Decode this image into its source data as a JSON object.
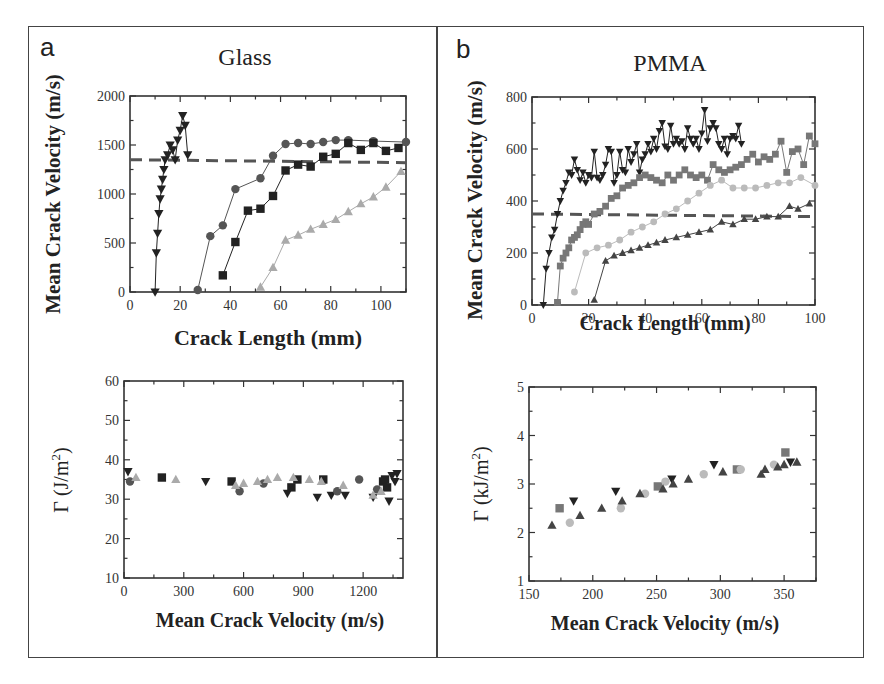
{
  "figure": {
    "panels": [
      {
        "letter": "a",
        "title": "Glass"
      },
      {
        "letter": "b",
        "title": "PMMA"
      }
    ]
  },
  "chart_data": [
    {
      "id": "glass-velocity",
      "panel": "a",
      "type": "line",
      "title": "Glass",
      "xlabel": "Crack Length (mm)",
      "ylabel": "Mean Crack Velocity (m/s)",
      "xlim": [
        0,
        110
      ],
      "ylim": [
        0,
        2000
      ],
      "xticks": [
        0,
        20,
        40,
        60,
        80,
        100
      ],
      "yticks": [
        0,
        500,
        1000,
        1500,
        2000
      ],
      "grid": false,
      "reference_line": {
        "style": "dashed",
        "y_start": 1350,
        "y_end": 1320,
        "color": "#555555"
      },
      "series": [
        {
          "name": "inverted-triangle",
          "marker": "tri-down",
          "color": "#222222",
          "x": [
            10,
            10.5,
            11,
            11.5,
            12,
            12.5,
            13,
            13.5,
            14,
            15,
            16,
            17,
            18,
            19,
            20,
            21,
            22,
            23
          ],
          "y": [
            0,
            400,
            600,
            800,
            950,
            1050,
            1150,
            1250,
            1350,
            1400,
            1500,
            1450,
            1350,
            1550,
            1650,
            1800,
            1700,
            1400
          ]
        },
        {
          "name": "circle",
          "marker": "circle",
          "color": "#555555",
          "x": [
            27,
            32,
            37,
            42,
            52,
            57,
            62,
            67,
            72,
            77,
            82,
            87,
            97,
            110
          ],
          "y": [
            20,
            570,
            680,
            1050,
            1160,
            1390,
            1510,
            1520,
            1510,
            1530,
            1550,
            1550,
            1540,
            1530
          ]
        },
        {
          "name": "square",
          "marker": "square",
          "color": "#222222",
          "x": [
            37,
            42,
            47,
            52,
            57,
            62,
            67,
            72,
            77,
            82,
            87,
            92,
            97,
            102,
            107
          ],
          "y": [
            170,
            510,
            830,
            850,
            980,
            1240,
            1300,
            1280,
            1380,
            1410,
            1520,
            1450,
            1520,
            1440,
            1470
          ]
        },
        {
          "name": "triangle",
          "marker": "tri-up",
          "color": "#aaaaaa",
          "x": [
            52,
            57,
            62,
            67,
            72,
            77,
            82,
            87,
            92,
            97,
            102,
            108
          ],
          "y": [
            50,
            250,
            530,
            580,
            640,
            690,
            740,
            820,
            900,
            970,
            1070,
            1230
          ]
        }
      ]
    },
    {
      "id": "glass-toughness",
      "panel": "a",
      "type": "scatter",
      "xlabel": "Mean Crack Velocity (m/s)",
      "ylabel": "Γ (J/m²)",
      "ylabel_base": "Γ (J/m",
      "ylabel_sup": "2",
      "ylabel_end": ")",
      "xlim": [
        0,
        1400
      ],
      "ylim": [
        10,
        60
      ],
      "xticks": [
        0,
        300,
        600,
        900,
        1200
      ],
      "yticks": [
        10,
        20,
        30,
        40,
        50,
        60
      ],
      "grid": false,
      "series": [
        {
          "name": "inverted-triangle",
          "marker": "tri-down",
          "color": "#222222",
          "x": [
            20,
            410,
            820,
            970,
            1040,
            1110,
            1250,
            1330,
            1345,
            1370,
            1360
          ],
          "y": [
            37,
            34.5,
            31.5,
            30.5,
            31,
            31,
            30.5,
            29.5,
            36,
            36.5,
            34.5
          ]
        },
        {
          "name": "circle",
          "marker": "circle",
          "color": "#555555",
          "x": [
            30,
            580,
            700,
            1070,
            1180,
            1270
          ],
          "y": [
            34.5,
            32,
            34,
            32,
            35,
            32.5
          ]
        },
        {
          "name": "square",
          "marker": "square",
          "color": "#222222",
          "x": [
            190,
            540,
            840,
            870,
            1000,
            1300,
            1320,
            1310
          ],
          "y": [
            35.5,
            34.5,
            33,
            35,
            35,
            34.5,
            33,
            35
          ]
        },
        {
          "name": "triangle",
          "marker": "tri-up",
          "color": "#aaaaaa",
          "x": [
            60,
            260,
            560,
            600,
            670,
            720,
            770,
            850,
            930,
            990,
            1100,
            1250,
            1290
          ],
          "y": [
            35.5,
            35,
            33.5,
            34,
            34.5,
            35,
            35.5,
            35.5,
            35,
            34.5,
            33.5,
            31,
            32
          ]
        }
      ]
    },
    {
      "id": "pmma-velocity",
      "panel": "b",
      "type": "line",
      "title": "PMMA",
      "xlabel": "Crack Length (mm)",
      "ylabel": "Mean Crack Velocity (m/s)",
      "xlim": [
        0,
        100
      ],
      "ylim": [
        0,
        800
      ],
      "xticks": [
        0,
        20,
        40,
        60,
        80,
        100
      ],
      "yticks": [
        0,
        200,
        400,
        600,
        800
      ],
      "grid": false,
      "reference_line": {
        "style": "dashed",
        "y_start": 350,
        "y_end": 340,
        "color": "#555555"
      },
      "series": [
        {
          "name": "inverted-triangle",
          "marker": "tri-down",
          "color": "#222222",
          "x": [
            4,
            5,
            6,
            7,
            8,
            9,
            10,
            11,
            12,
            13,
            14,
            15,
            16,
            17,
            18,
            19,
            20,
            21,
            22,
            23,
            24,
            25,
            26,
            27,
            28,
            29,
            30,
            31,
            32,
            33,
            34,
            35,
            36,
            37,
            38,
            39,
            40,
            41,
            42,
            43,
            44,
            45,
            46,
            47,
            48,
            49,
            50,
            51,
            52,
            53,
            54,
            55,
            56,
            57,
            58,
            59,
            60,
            61,
            62,
            63,
            64,
            65,
            66,
            67,
            68,
            69,
            70,
            71,
            72,
            73,
            74
          ],
          "y": [
            0,
            140,
            200,
            260,
            290,
            350,
            400,
            440,
            470,
            510,
            500,
            560,
            520,
            480,
            510,
            470,
            500,
            490,
            590,
            490,
            480,
            500,
            540,
            600,
            590,
            470,
            500,
            590,
            520,
            510,
            600,
            550,
            580,
            620,
            510,
            560,
            580,
            620,
            590,
            640,
            600,
            670,
            700,
            610,
            600,
            690,
            620,
            640,
            620,
            630,
            600,
            680,
            640,
            620,
            640,
            600,
            660,
            750,
            630,
            680,
            700,
            680,
            620,
            600,
            640,
            580,
            640,
            650,
            640,
            690,
            620
          ]
        },
        {
          "name": "square",
          "marker": "square",
          "color": "#777777",
          "x": [
            9,
            10,
            11,
            12,
            13,
            14,
            15,
            16,
            17,
            18,
            19,
            20,
            22,
            24,
            26,
            28,
            30,
            32,
            34,
            36,
            38,
            40,
            42,
            44,
            46,
            48,
            50,
            52,
            54,
            56,
            58,
            60,
            62,
            64,
            66,
            68,
            70,
            72,
            74,
            76,
            78,
            80,
            82,
            84,
            86,
            88,
            90,
            92,
            94,
            96,
            98,
            100
          ],
          "y": [
            10,
            150,
            180,
            200,
            220,
            250,
            260,
            270,
            290,
            310,
            320,
            310,
            350,
            360,
            380,
            410,
            420,
            450,
            460,
            470,
            490,
            500,
            490,
            480,
            470,
            500,
            480,
            500,
            520,
            500,
            490,
            500,
            480,
            540,
            520,
            510,
            520,
            530,
            540,
            560,
            580,
            550,
            570,
            560,
            580,
            630,
            510,
            590,
            600,
            540,
            650,
            620
          ]
        },
        {
          "name": "circle",
          "marker": "circle",
          "color": "#bbbbbb",
          "x": [
            15,
            19,
            23,
            27,
            31,
            35,
            39,
            43,
            47,
            51,
            55,
            59,
            63,
            67,
            71,
            75,
            79,
            83,
            87,
            91,
            95,
            100
          ],
          "y": [
            50,
            200,
            220,
            230,
            250,
            280,
            300,
            320,
            350,
            370,
            400,
            430,
            460,
            480,
            450,
            450,
            450,
            460,
            470,
            470,
            490,
            460
          ]
        },
        {
          "name": "triangle",
          "marker": "tri-up",
          "color": "#444444",
          "x": [
            22,
            26,
            29,
            32,
            35,
            38,
            41,
            44,
            47,
            51,
            55,
            59,
            63,
            67,
            71,
            75,
            79,
            83,
            87,
            91,
            94,
            98
          ],
          "y": [
            20,
            170,
            190,
            200,
            210,
            220,
            230,
            240,
            250,
            260,
            270,
            280,
            290,
            320,
            310,
            330,
            330,
            340,
            340,
            380,
            370,
            390
          ]
        }
      ]
    },
    {
      "id": "pmma-toughness",
      "panel": "b",
      "type": "scatter",
      "xlabel": "Mean Crack Velocity (m/s)",
      "ylabel": "Γ (kJ/m²)",
      "ylabel_base": "Γ (kJ/m",
      "ylabel_sup": "2",
      "ylabel_end": ")",
      "xlim": [
        150,
        375
      ],
      "ylim": [
        1,
        5
      ],
      "xticks": [
        150,
        200,
        250,
        300,
        350
      ],
      "yticks": [
        1,
        2,
        3,
        4,
        5
      ],
      "grid": false,
      "series": [
        {
          "name": "inverted-triangle",
          "marker": "tri-down",
          "color": "#222222",
          "x": [
            185,
            218,
            262,
            295,
            355
          ],
          "y": [
            2.65,
            2.85,
            3.1,
            3.4,
            3.45
          ]
        },
        {
          "name": "square",
          "marker": "square",
          "color": "#777777",
          "x": [
            174,
            251,
            313,
            351
          ],
          "y": [
            2.5,
            2.95,
            3.3,
            3.65
          ]
        },
        {
          "name": "circle",
          "marker": "circle",
          "color": "#bbbbbb",
          "x": [
            182,
            222,
            241,
            257,
            287,
            316,
            342
          ],
          "y": [
            2.2,
            2.5,
            2.8,
            3.05,
            3.2,
            3.3,
            3.4
          ]
        },
        {
          "name": "triangle",
          "marker": "tri-up",
          "color": "#444444",
          "x": [
            168,
            190,
            207,
            223,
            237,
            255,
            263,
            275,
            302,
            332,
            335,
            345,
            350,
            360
          ],
          "y": [
            2.15,
            2.35,
            2.5,
            2.65,
            2.8,
            2.9,
            3.0,
            3.1,
            3.25,
            3.2,
            3.3,
            3.35,
            3.4,
            3.45
          ]
        }
      ]
    }
  ]
}
